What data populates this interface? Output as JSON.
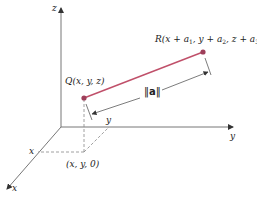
{
  "diagram": {
    "type": "3d-coordinate-vector",
    "colors": {
      "axis": "#777777",
      "vector": "#c0506a",
      "point": "#9e3f5a",
      "dashed": "#777777",
      "text": "#222222"
    },
    "axes": {
      "z_label": "z",
      "y_label": "y",
      "x_label": "x"
    },
    "points": {
      "Q": {
        "label_prefix": "Q",
        "label_args": "(x, y, z)"
      },
      "R": {
        "label_prefix": "R",
        "label_args_1": "(x + a",
        "sub1": "1",
        "label_args_2": ", y + a",
        "sub2": "2",
        "label_args_3": ", z + a",
        "sub3": "3",
        "label_args_4": ")"
      }
    },
    "norm_label": {
      "left": "‖",
      "symbol": "a",
      "right": "‖"
    },
    "projection": {
      "label": "(x, y, 0)",
      "x_mark": "x",
      "y_mark": "y"
    }
  }
}
